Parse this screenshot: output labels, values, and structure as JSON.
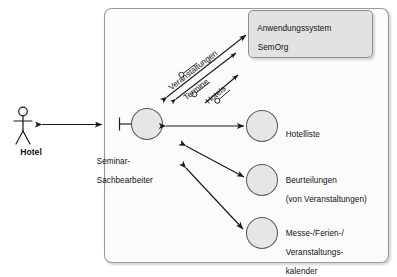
{
  "diagram": {
    "type": "uml-component-context-diagram",
    "background_color": "#ffffff",
    "stroke_color": "#1a1a1a",
    "node_fill_color": "#e6e6e6",
    "box_fill_color": "#e2e2e2",
    "boundary_fill_color": "#fbfbfb",
    "external_actor": {
      "name": "Hotel",
      "label": "Hotel",
      "shape": "stick-figure"
    },
    "system_boundary": {
      "name": "system-boundary",
      "shape": "rounded-rectangle"
    },
    "application_system_box": {
      "line1": "Anwendungssystem",
      "line2": "SemOrg"
    },
    "central_node": {
      "line1": "Seminar-",
      "line2": "Sachbearbeiter",
      "interface_stub": "required-interface-socket"
    },
    "nodes": [
      {
        "id": "hotelliste",
        "lines": [
          "Hotelliste"
        ]
      },
      {
        "id": "beurteilungen",
        "lines": [
          "Beurteilungen",
          "(von Veranstaltungen)"
        ]
      },
      {
        "id": "kalender",
        "lines": [
          "Messe-/Ferien-/",
          "Veranstaltungs-",
          "kalender"
        ]
      }
    ],
    "interface_connectors": [
      {
        "id": "veranstaltungen",
        "label": "Veranstaltungen",
        "marker": "ball-socket"
      },
      {
        "id": "termine",
        "label": "Termine",
        "marker": "ball-socket"
      },
      {
        "id": "hotels",
        "label": "Hotels",
        "marker": "ball-socket"
      }
    ],
    "connections": [
      {
        "from": "Hotel",
        "to": "system-boundary",
        "style": "double-arrow"
      },
      {
        "from": "Seminar-Sachbearbeiter",
        "to": "Hotelliste",
        "style": "double-arrow"
      },
      {
        "from": "Seminar-Sachbearbeiter",
        "to": "Beurteilungen",
        "style": "double-arrow"
      },
      {
        "from": "Seminar-Sachbearbeiter",
        "to": "Messe-/Ferien-/Veranstaltungskalender",
        "style": "double-arrow"
      },
      {
        "from": "Seminar-Sachbearbeiter",
        "to": "Anwendungssystem SemOrg",
        "style": "double-arrow"
      }
    ]
  }
}
